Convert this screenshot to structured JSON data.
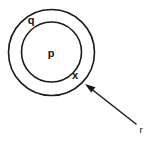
{
  "diagram": {
    "type": "concentric-circles-with-pointer",
    "background_color": "#ffffff",
    "stroke_color": "#1a1a1a",
    "text_color": "#141414",
    "outer_circle": {
      "label": "q",
      "center_x": 51.5,
      "center_y": 52.5,
      "radius": 43
    },
    "inner_circle": {
      "label": "p",
      "center_x": 51.5,
      "center_y": 52,
      "radius": 30
    },
    "labels": {
      "outer_region": "q",
      "inner_region": "p",
      "boundary_point": "x",
      "pointer_label": "r"
    },
    "label_positions": {
      "q": {
        "x": 31,
        "y": 21
      },
      "p": {
        "x": 51,
        "y": 54
      },
      "x": {
        "x": 75,
        "y": 76
      },
      "r": {
        "x": 141,
        "y": 130
      }
    },
    "arrow": {
      "label": "r",
      "tail_x": 136,
      "tail_y": 124,
      "tip_x": 85,
      "tip_y": 84,
      "points_to": "x"
    }
  }
}
